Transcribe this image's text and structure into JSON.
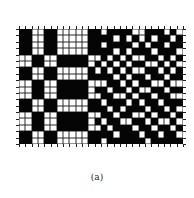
{
  "figure": {
    "caption": "(a)",
    "grid": {
      "columns": 26,
      "rows_count": 18,
      "legend": {
        "B": "black cell",
        "W": "white cell"
      },
      "colors": {
        "black": "#050505",
        "white": "#ffffff"
      },
      "rows": [
        "BBWWBBWWWWWBBWBBBBWWBBBWBW",
        "BBWWBBWWWWWBBBBWBWBWBWBBWB",
        "BBWWBBWWWWWBBWBBBBWBWBBWBB",
        "BBWWBBWWWWWBBBBWBWBBBWBBBW",
        "WWBBWWBBBBBWWBWBWBWWBBWBWB",
        "WWBBWWBBBBBWBWBWBWBBWWBWBW",
        "BBWWBBWWWWWBWBWBWBWWBBWBWB",
        "BBWWBBWWWWWBBBBWBWBBWBBWBB",
        "WWBBWWBBBBBWWWBBWBWBBWWBWW",
        "WWBBWWBBBBBWBBWBBWBWWBBWBB",
        "WWBBWWBBBBBWWBBWWBWBBWBBWW",
        "BBWWBBWWWWWBBWBBBWBWBBWBBB",
        "BBWWBBWWWWWBBBWBWBBBWBBWBW",
        "WWBBWWBBBBBWWBBWBBWWBWBBWB",
        "WWBBWWBBBBBWBWBBWWBBWBWWBW",
        "WWBBWWBBBBBWWBWBBBWBBWBBWB",
        "BBWWBBWWWWWBBBBWBBBWBBWBBW",
        "BBWWBBWWWWWBBWBBBBBBWBBBBB"
      ]
    }
  }
}
